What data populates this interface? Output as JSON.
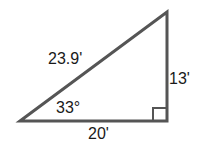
{
  "diagram": {
    "type": "right-triangle",
    "stroke_color": "#555555",
    "labels": {
      "hypotenuse": "23.9'",
      "vertical_leg": "13'",
      "horizontal_leg": "20'",
      "angle": "33°"
    },
    "right_angle_marker": true
  }
}
